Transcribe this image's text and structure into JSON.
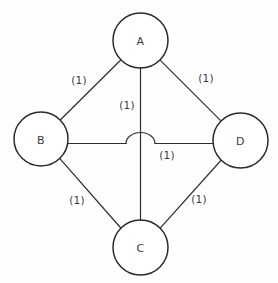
{
  "diagram": {
    "background_color": "#fefefe",
    "stroke_color": "#2e2e2e",
    "text_color": "#3a3a3a",
    "node_fill": "#ffffff",
    "width": 278,
    "height": 283,
    "nodes": [
      {
        "id": "A",
        "label": "A",
        "cx": 140.5,
        "cy": 40.5,
        "r": 27.5
      },
      {
        "id": "B",
        "label": "B",
        "cx": 41.0,
        "cy": 139.0,
        "r": 27.0
      },
      {
        "id": "C",
        "label": "C",
        "cx": 140.5,
        "cy": 247.5,
        "r": 27.5
      },
      {
        "id": "D",
        "label": "D",
        "cx": 240.5,
        "cy": 140.5,
        "r": 27.5
      }
    ],
    "edges": [
      {
        "id": "edge-ab",
        "from": "A",
        "to": "B",
        "weight": "(1)",
        "label_x": 79,
        "label_y": 80
      },
      {
        "id": "edge-ad",
        "from": "A",
        "to": "D",
        "weight": "(1)",
        "label_x": 206,
        "label_y": 78
      },
      {
        "id": "edge-ac",
        "from": "A",
        "to": "C",
        "weight": "(1)",
        "label_x": 127,
        "label_y": 105
      },
      {
        "id": "edge-bd",
        "from": "B",
        "to": "D",
        "weight": "(1)",
        "label_x": 167,
        "label_y": 155
      },
      {
        "id": "edge-bc",
        "from": "B",
        "to": "C",
        "weight": "(1)",
        "label_x": 77,
        "label_y": 200
      },
      {
        "id": "edge-cd",
        "from": "C",
        "to": "D",
        "weight": "(1)",
        "label_x": 199,
        "label_y": 199
      }
    ],
    "crossing": {
      "name": "hop-bridge",
      "description": "B-D horizontal edge hops over A-C vertical edge",
      "line_y": 143.5,
      "arc_left_x": 126,
      "arc_right_x": 155,
      "arc_peak_y": 133
    }
  }
}
